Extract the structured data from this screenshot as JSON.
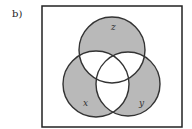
{
  "figure": {
    "part_label": "b)",
    "universe": {
      "x": 42,
      "y": 6,
      "width": 140,
      "height": 121,
      "stroke": "#222222"
    },
    "sets": [
      {
        "id": "z",
        "label": "z",
        "cx": 112,
        "cy": 50,
        "r": 33,
        "label_x": 113,
        "label_y": 30
      },
      {
        "id": "x",
        "label": "x",
        "cx": 96,
        "cy": 84,
        "r": 33,
        "label_x": 85,
        "label_y": 106
      },
      {
        "id": "y",
        "label": "y",
        "cx": 128,
        "cy": 84,
        "r": 32,
        "label_x": 140,
        "label_y": 106
      }
    ],
    "shaded_regions": [
      "only x",
      "only y",
      "only z"
    ],
    "shade_color": "#b9b9b9",
    "outline_color": "#333333"
  }
}
